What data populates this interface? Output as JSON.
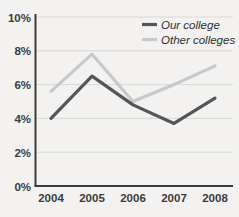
{
  "chart_data": {
    "type": "line",
    "title": "",
    "xlabel": "",
    "ylabel": "",
    "categories": [
      "2004",
      "2005",
      "2006",
      "2007",
      "2008"
    ],
    "x": [
      2004,
      2005,
      2006,
      2007,
      2008
    ],
    "ylim": [
      0,
      10
    ],
    "ytick_labels": [
      "0%",
      "2%",
      "4%",
      "6%",
      "8%",
      "10%"
    ],
    "ytick_values": [
      0,
      2,
      4,
      6,
      8,
      10
    ],
    "grid": true,
    "grid_axis": "y",
    "legend_position": "top-right",
    "series": [
      {
        "name": "Our college",
        "color": "#555555",
        "values": [
          4.0,
          6.5,
          4.8,
          3.7,
          5.2
        ]
      },
      {
        "name": "Other colleges",
        "color": "#c9c9c9",
        "values": [
          5.6,
          7.8,
          5.0,
          6.0,
          7.1
        ]
      }
    ]
  },
  "axes": {
    "y_labels": [
      "10%",
      "8%",
      "6%",
      "4%",
      "2%",
      "0%"
    ],
    "x_labels": [
      "2004",
      "2005",
      "2006",
      "2007",
      "2008"
    ]
  },
  "legend": {
    "items": [
      {
        "label": "Our college",
        "color": "#555555"
      },
      {
        "label": "Other colleges",
        "color": "#c9c9c9"
      }
    ]
  },
  "colors": {
    "background": "#f3f2f0",
    "axis": "#3b3b3b",
    "grid": "#d8d8d6",
    "series_primary": "#555555",
    "series_secondary": "#c9c9c9",
    "text": "#3b3b3b"
  }
}
